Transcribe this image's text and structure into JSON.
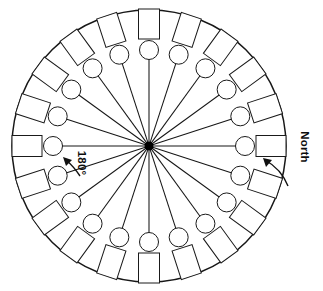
{
  "diagram": {
    "type": "radial-wheel",
    "geometry": {
      "canvas_width": 323,
      "canvas_height": 291,
      "center_x": 149,
      "center_y": 146,
      "outer_radius": 136,
      "spoke_count": 20,
      "spoke_step_degrees": 18,
      "spoke_inner_radius": 3,
      "spoke_outer_radius": 88,
      "node_circle_radius": 9.5,
      "node_circle_center_radius": 96,
      "node_rect_width": 30,
      "node_rect_height": 21,
      "node_rect_center_radius": 122
    },
    "colors": {
      "stroke": "#1a1a1a",
      "fill": "#ffffff",
      "hub": "#000000",
      "annotation": "#111111"
    },
    "annotations": [
      {
        "id": "north",
        "label": "North",
        "bearing_degrees": 0,
        "text_x": 301,
        "text_y": 147,
        "rotation_degrees": 90,
        "arrow_target": "east-rectangle"
      },
      {
        "id": "one-eighty",
        "label": "180°",
        "bearing_degrees": 180,
        "text_x": 76,
        "text_y": 161,
        "rotation_degrees": 90,
        "arrow_target": "west-circle"
      }
    ],
    "spokes": [
      {
        "index": 0,
        "angle_degrees": 0,
        "node": "circle+rectangle"
      },
      {
        "index": 1,
        "angle_degrees": 18,
        "node": "circle+rectangle"
      },
      {
        "index": 2,
        "angle_degrees": 36,
        "node": "circle+rectangle"
      },
      {
        "index": 3,
        "angle_degrees": 54,
        "node": "circle+rectangle"
      },
      {
        "index": 4,
        "angle_degrees": 72,
        "node": "circle+rectangle"
      },
      {
        "index": 5,
        "angle_degrees": 90,
        "node": "circle+rectangle"
      },
      {
        "index": 6,
        "angle_degrees": 108,
        "node": "circle+rectangle"
      },
      {
        "index": 7,
        "angle_degrees": 126,
        "node": "circle+rectangle"
      },
      {
        "index": 8,
        "angle_degrees": 144,
        "node": "circle+rectangle"
      },
      {
        "index": 9,
        "angle_degrees": 162,
        "node": "circle+rectangle"
      },
      {
        "index": 10,
        "angle_degrees": 180,
        "node": "circle+rectangle"
      },
      {
        "index": 11,
        "angle_degrees": 198,
        "node": "circle+rectangle"
      },
      {
        "index": 12,
        "angle_degrees": 216,
        "node": "circle+rectangle"
      },
      {
        "index": 13,
        "angle_degrees": 234,
        "node": "circle+rectangle"
      },
      {
        "index": 14,
        "angle_degrees": 252,
        "node": "circle+rectangle"
      },
      {
        "index": 15,
        "angle_degrees": 270,
        "node": "circle+rectangle"
      },
      {
        "index": 16,
        "angle_degrees": 288,
        "node": "circle+rectangle"
      },
      {
        "index": 17,
        "angle_degrees": 306,
        "node": "circle+rectangle"
      },
      {
        "index": 18,
        "angle_degrees": 324,
        "node": "circle+rectangle"
      },
      {
        "index": 19,
        "angle_degrees": 342,
        "node": "circle+rectangle"
      }
    ]
  }
}
